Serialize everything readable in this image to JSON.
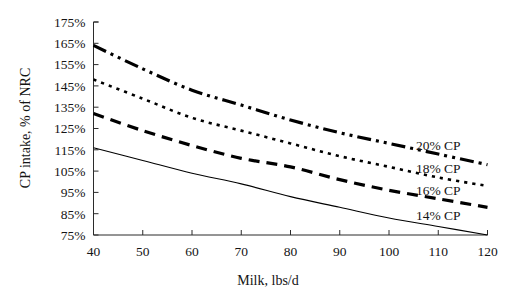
{
  "chart_data": {
    "type": "line",
    "title": "",
    "xlabel": "Milk, lbs/d",
    "ylabel": "CP intake, % of NRC",
    "xlim": [
      40,
      120
    ],
    "ylim": [
      75,
      175
    ],
    "xticks": [
      40,
      50,
      60,
      70,
      80,
      90,
      100,
      110,
      120
    ],
    "xtick_labels": [
      "40",
      "50",
      "60",
      "70",
      "80",
      "90",
      "100",
      "110",
      "120"
    ],
    "yticks": [
      75,
      85,
      95,
      105,
      115,
      125,
      135,
      145,
      155,
      165,
      175
    ],
    "ytick_labels": [
      "75%",
      "85%",
      "95%",
      "105%",
      "115%",
      "125%",
      "135%",
      "145%",
      "155%",
      "165%",
      "175%"
    ],
    "grid": false,
    "legend_position": "inline-right-of-curves",
    "x": [
      40,
      50,
      60,
      70,
      80,
      90,
      100,
      110,
      120
    ],
    "series": [
      {
        "name": "20% CP",
        "label": "20% CP",
        "style": "dash-dot-dot",
        "width": 3.2,
        "color": "#000000",
        "values": [
          164,
          153,
          143,
          136,
          129,
          123,
          118,
          113,
          108
        ]
      },
      {
        "name": "18% CP",
        "label": "18% CP",
        "style": "dotted",
        "width": 2.6,
        "color": "#000000",
        "values": [
          148,
          139,
          130,
          124,
          118,
          112,
          107,
          102,
          98
        ]
      },
      {
        "name": "16% CP",
        "label": "16% CP",
        "style": "dashed",
        "width": 3.2,
        "color": "#000000",
        "values": [
          132,
          124,
          117,
          111,
          107,
          101,
          96,
          92,
          88
        ]
      },
      {
        "name": "14% CP",
        "label": "14% CP",
        "style": "solid",
        "width": 1.1,
        "color": "#000000",
        "values": [
          116,
          110,
          104,
          99,
          93,
          88,
          83,
          79,
          75
        ]
      }
    ],
    "series_label_positions": [
      {
        "name": "20% CP",
        "x": 110,
        "y": 115
      },
      {
        "name": "18% CP",
        "x": 110,
        "y": 104
      },
      {
        "name": "16% CP",
        "x": 110,
        "y": 94
      },
      {
        "name": "14% CP",
        "x": 110,
        "y": 82
      }
    ]
  }
}
